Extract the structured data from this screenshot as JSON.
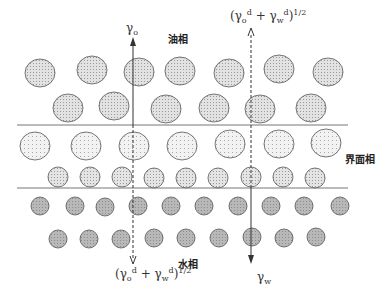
{
  "diagram": {
    "phase_labels": {
      "oil": "油相",
      "interface": "界面相",
      "water": "水相"
    },
    "arrows": {
      "left": {
        "top_symbol": "γ",
        "top_subscript": "o",
        "bottom_expr": {
          "open": "(γ",
          "o_sub": "o",
          "o_sup": "d",
          "plus": " + γ",
          "w_sub": "w",
          "w_sup": "d",
          "close": ")",
          "power": "1/2"
        }
      },
      "right": {
        "top_expr": {
          "open": "(γ",
          "o_sub": "o",
          "o_sup": "d",
          "plus": " + γ",
          "w_sub": "w",
          "w_sup": "d",
          "close": ")",
          "power": "1/2"
        },
        "bottom_symbol": "γ",
        "bottom_subscript": "w"
      }
    },
    "colors": {
      "oil_fill": "#dcdcdc",
      "interface_fill": "#ececec",
      "water_fill": "#b4b4b4",
      "stroke": "#555555",
      "line": "#777777"
    }
  }
}
